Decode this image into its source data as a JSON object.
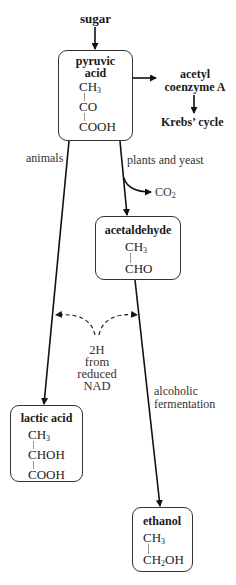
{
  "diagram": {
    "type": "metabolic-pathway",
    "start": "sugar",
    "nodes": {
      "pyruvic_acid": {
        "title_line1": "pyruvic",
        "title_line2": "acid",
        "formula": [
          "CH3",
          "CO",
          "COOH"
        ]
      },
      "acetyl_coa": {
        "line1": "acetyl",
        "line2": "coenzyme A"
      },
      "krebs": {
        "label": "Krebs’ cycle"
      },
      "acetaldehyde": {
        "title": "acetaldehyde",
        "formula": [
          "CH3",
          "CHO"
        ]
      },
      "lactic_acid": {
        "title": "lactic acid",
        "formula": [
          "CH3",
          "CHOH",
          "COOH"
        ]
      },
      "ethanol": {
        "title": "ethanol",
        "formula": [
          "CH3",
          "CH2OH"
        ]
      }
    },
    "labels": {
      "sugar": "sugar",
      "animals": "animals",
      "plants_yeast": "plants and yeast",
      "co2": "CO",
      "co2_sub": "2",
      "nad": [
        "2H",
        "from",
        "reduced",
        "NAD"
      ],
      "alcoholic": [
        "alcoholic",
        "fermentation"
      ]
    },
    "edges": [
      {
        "from": "sugar",
        "to": "pyruvic acid"
      },
      {
        "from": "pyruvic acid",
        "to": "acetyl coenzyme A"
      },
      {
        "from": "acetyl coenzyme A",
        "to": "Krebs’ cycle"
      },
      {
        "from": "pyruvic acid",
        "to": "lactic acid",
        "label": "animals"
      },
      {
        "from": "pyruvic acid",
        "to": "acetaldehyde",
        "label": "plants and yeast",
        "byproduct": "CO2"
      },
      {
        "from": "acetaldehyde",
        "to": "ethanol",
        "label": "alcoholic fermentation"
      },
      {
        "from": "2H from reduced NAD",
        "to": [
          "lactic acid path",
          "ethanol path"
        ],
        "style": "dashed"
      }
    ],
    "colors": {
      "line": "#111111",
      "box_border": "#333333",
      "bond": "#999999"
    }
  }
}
